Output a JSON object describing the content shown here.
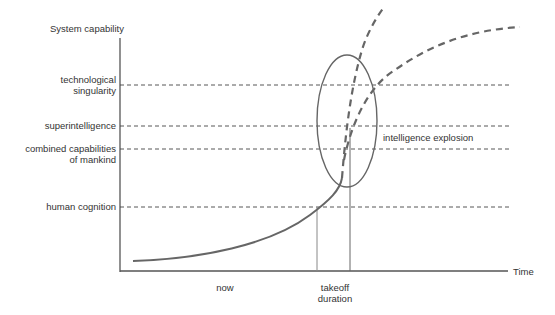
{
  "diagram": {
    "y_axis_label": "System capability",
    "x_axis_label": "Time",
    "levels": [
      {
        "label_line1": "technological",
        "label_line2": "singularity"
      },
      {
        "label_line1": "superintelligence",
        "label_line2": ""
      },
      {
        "label_line1": "combined capabilities",
        "label_line2": "of mankind"
      },
      {
        "label_line1": "human cognition",
        "label_line2": ""
      }
    ],
    "x_labels": {
      "now": "now",
      "takeoff_line1": "takeoff",
      "takeoff_line2": "duration"
    },
    "annotation": "intelligence explosion",
    "colors": {
      "curve": "#666666",
      "axis": "#555555",
      "dashed": "#444444",
      "text": "#333333"
    }
  }
}
